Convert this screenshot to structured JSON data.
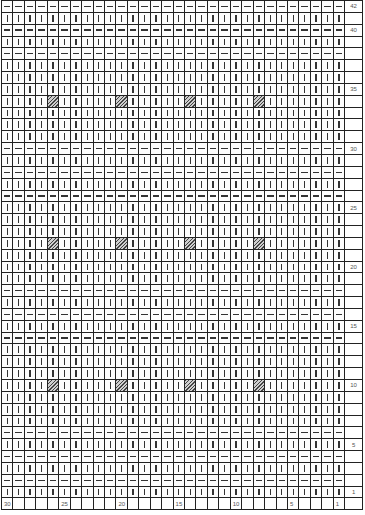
{
  "chart_data": {
    "type": "table",
    "title": "",
    "columns": 30,
    "rows": 42,
    "column_labels": {
      "30": "30",
      "25": "25",
      "20": "20",
      "15": "15",
      "10": "10",
      "5": "5",
      "1": "1"
    },
    "row_labels": {
      "42": "42",
      "40": "40",
      "35": "35",
      "30": "30",
      "25": "25",
      "20": "20",
      "15": "15",
      "10": "10",
      "5": "5",
      "1": "1"
    },
    "legend": {
      "knit": "vertical bar",
      "purl": "horizontal dash",
      "special": "hatched square"
    },
    "purl_rows": [
      42,
      40,
      38,
      30,
      28,
      26,
      18,
      16,
      14,
      6,
      4,
      2
    ],
    "hatched_cells": [
      {
        "row": 34,
        "cols": [
          26,
          20,
          14,
          8
        ]
      },
      {
        "row": 22,
        "cols": [
          26,
          20,
          14,
          8
        ]
      },
      {
        "row": 10,
        "cols": [
          26,
          20,
          14,
          8
        ]
      }
    ]
  }
}
